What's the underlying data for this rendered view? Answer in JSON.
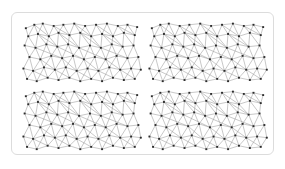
{
  "figure": {
    "title": "",
    "caption": "",
    "background_color": "#ffffff",
    "card_color": "#ffffff",
    "card_border_color": "#dcdcdc",
    "node_color": "#2b2b2b",
    "edge_color": "#9a9a9a",
    "panel_count": 4,
    "grid_rows": 2,
    "grid_cols": 2
  },
  "chart_data": {
    "type": "scatter",
    "title": "",
    "subtitle": "",
    "xlabel": "",
    "ylabel": "",
    "xlim": [
      0,
      100
    ],
    "ylim": [
      0,
      56
    ],
    "grid": false,
    "legend": [],
    "legend_position": "none",
    "annotations": [],
    "panels": [
      {
        "id": "panel-top-left",
        "label": "",
        "row": 0,
        "col": 0
      },
      {
        "id": "panel-top-right",
        "label": "",
        "row": 0,
        "col": 1
      },
      {
        "id": "panel-bottom-left",
        "label": "",
        "row": 1,
        "col": 0
      },
      {
        "id": "panel-bottom-right",
        "label": "",
        "row": 1,
        "col": 1
      }
    ],
    "node_marker": "square",
    "node_size": 1.6,
    "nodes": [
      [
        4,
        48
      ],
      [
        11,
        51
      ],
      [
        18,
        52
      ],
      [
        27,
        50
      ],
      [
        35,
        51
      ],
      [
        44,
        52
      ],
      [
        53,
        50
      ],
      [
        62,
        51
      ],
      [
        71,
        52
      ],
      [
        80,
        50
      ],
      [
        88,
        51
      ],
      [
        96,
        49
      ],
      [
        6,
        41
      ],
      [
        14,
        43
      ],
      [
        23,
        41
      ],
      [
        31,
        44
      ],
      [
        40,
        42
      ],
      [
        49,
        44
      ],
      [
        58,
        41
      ],
      [
        67,
        43
      ],
      [
        76,
        41
      ],
      [
        85,
        44
      ],
      [
        94,
        42
      ],
      [
        3,
        33
      ],
      [
        12,
        31
      ],
      [
        21,
        34
      ],
      [
        30,
        32
      ],
      [
        39,
        34
      ],
      [
        48,
        31
      ],
      [
        57,
        33
      ],
      [
        66,
        31
      ],
      [
        75,
        34
      ],
      [
        84,
        32
      ],
      [
        93,
        33
      ],
      [
        7,
        23
      ],
      [
        16,
        21
      ],
      [
        25,
        24
      ],
      [
        34,
        22
      ],
      [
        43,
        24
      ],
      [
        52,
        21
      ],
      [
        61,
        23
      ],
      [
        70,
        21
      ],
      [
        79,
        24
      ],
      [
        88,
        22
      ],
      [
        97,
        23
      ],
      [
        2,
        13
      ],
      [
        10,
        11
      ],
      [
        19,
        14
      ],
      [
        28,
        12
      ],
      [
        37,
        14
      ],
      [
        46,
        11
      ],
      [
        55,
        13
      ],
      [
        64,
        11
      ],
      [
        73,
        14
      ],
      [
        82,
        12
      ],
      [
        91,
        13
      ],
      [
        99,
        12
      ],
      [
        5,
        4
      ],
      [
        13,
        2
      ],
      [
        22,
        5
      ],
      [
        31,
        3
      ],
      [
        40,
        5
      ],
      [
        49,
        2
      ],
      [
        58,
        4
      ],
      [
        67,
        2
      ],
      [
        76,
        5
      ],
      [
        85,
        3
      ],
      [
        94,
        4
      ]
    ],
    "edges": [
      [
        0,
        1
      ],
      [
        1,
        2
      ],
      [
        2,
        3
      ],
      [
        3,
        4
      ],
      [
        4,
        5
      ],
      [
        5,
        6
      ],
      [
        6,
        7
      ],
      [
        7,
        8
      ],
      [
        8,
        9
      ],
      [
        9,
        10
      ],
      [
        10,
        11
      ],
      [
        12,
        13
      ],
      [
        13,
        14
      ],
      [
        14,
        15
      ],
      [
        15,
        16
      ],
      [
        16,
        17
      ],
      [
        17,
        18
      ],
      [
        18,
        19
      ],
      [
        19,
        20
      ],
      [
        20,
        21
      ],
      [
        21,
        22
      ],
      [
        23,
        24
      ],
      [
        24,
        25
      ],
      [
        25,
        26
      ],
      [
        26,
        27
      ],
      [
        27,
        28
      ],
      [
        28,
        29
      ],
      [
        29,
        30
      ],
      [
        30,
        31
      ],
      [
        31,
        32
      ],
      [
        32,
        33
      ],
      [
        34,
        35
      ],
      [
        35,
        36
      ],
      [
        36,
        37
      ],
      [
        37,
        38
      ],
      [
        38,
        39
      ],
      [
        39,
        40
      ],
      [
        40,
        41
      ],
      [
        41,
        42
      ],
      [
        42,
        43
      ],
      [
        43,
        44
      ],
      [
        45,
        46
      ],
      [
        46,
        47
      ],
      [
        47,
        48
      ],
      [
        48,
        49
      ],
      [
        49,
        50
      ],
      [
        50,
        51
      ],
      [
        51,
        52
      ],
      [
        52,
        53
      ],
      [
        53,
        54
      ],
      [
        54,
        55
      ],
      [
        55,
        56
      ],
      [
        57,
        58
      ],
      [
        58,
        59
      ],
      [
        59,
        60
      ],
      [
        60,
        61
      ],
      [
        61,
        62
      ],
      [
        62,
        63
      ],
      [
        63,
        64
      ],
      [
        64,
        65
      ],
      [
        65,
        66
      ],
      [
        66,
        67
      ],
      [
        0,
        12
      ],
      [
        1,
        12
      ],
      [
        1,
        13
      ],
      [
        2,
        13
      ],
      [
        2,
        14
      ],
      [
        3,
        14
      ],
      [
        3,
        15
      ],
      [
        4,
        15
      ],
      [
        4,
        16
      ],
      [
        5,
        16
      ],
      [
        5,
        17
      ],
      [
        6,
        17
      ],
      [
        6,
        18
      ],
      [
        7,
        18
      ],
      [
        7,
        19
      ],
      [
        8,
        19
      ],
      [
        8,
        20
      ],
      [
        9,
        20
      ],
      [
        9,
        21
      ],
      [
        10,
        21
      ],
      [
        10,
        22
      ],
      [
        11,
        22
      ],
      [
        12,
        23
      ],
      [
        12,
        24
      ],
      [
        13,
        24
      ],
      [
        13,
        25
      ],
      [
        14,
        25
      ],
      [
        14,
        26
      ],
      [
        15,
        26
      ],
      [
        15,
        27
      ],
      [
        16,
        27
      ],
      [
        16,
        28
      ],
      [
        17,
        28
      ],
      [
        17,
        29
      ],
      [
        18,
        29
      ],
      [
        18,
        30
      ],
      [
        19,
        30
      ],
      [
        19,
        31
      ],
      [
        20,
        31
      ],
      [
        20,
        32
      ],
      [
        21,
        32
      ],
      [
        21,
        33
      ],
      [
        22,
        33
      ],
      [
        23,
        34
      ],
      [
        24,
        34
      ],
      [
        24,
        35
      ],
      [
        25,
        35
      ],
      [
        25,
        36
      ],
      [
        26,
        36
      ],
      [
        26,
        37
      ],
      [
        27,
        37
      ],
      [
        27,
        38
      ],
      [
        28,
        38
      ],
      [
        28,
        39
      ],
      [
        29,
        39
      ],
      [
        29,
        40
      ],
      [
        30,
        40
      ],
      [
        30,
        41
      ],
      [
        31,
        41
      ],
      [
        31,
        42
      ],
      [
        32,
        42
      ],
      [
        32,
        43
      ],
      [
        33,
        43
      ],
      [
        33,
        44
      ],
      [
        34,
        45
      ],
      [
        34,
        46
      ],
      [
        35,
        46
      ],
      [
        35,
        47
      ],
      [
        36,
        47
      ],
      [
        36,
        48
      ],
      [
        37,
        48
      ],
      [
        37,
        49
      ],
      [
        38,
        49
      ],
      [
        38,
        50
      ],
      [
        39,
        50
      ],
      [
        39,
        51
      ],
      [
        40,
        51
      ],
      [
        40,
        52
      ],
      [
        41,
        52
      ],
      [
        41,
        53
      ],
      [
        42,
        53
      ],
      [
        42,
        54
      ],
      [
        43,
        54
      ],
      [
        43,
        55
      ],
      [
        44,
        55
      ],
      [
        44,
        56
      ],
      [
        45,
        57
      ],
      [
        46,
        57
      ],
      [
        46,
        58
      ],
      [
        47,
        58
      ],
      [
        47,
        59
      ],
      [
        48,
        59
      ],
      [
        48,
        60
      ],
      [
        49,
        60
      ],
      [
        49,
        61
      ],
      [
        50,
        61
      ],
      [
        50,
        62
      ],
      [
        51,
        62
      ],
      [
        51,
        63
      ],
      [
        52,
        63
      ],
      [
        52,
        64
      ],
      [
        53,
        64
      ],
      [
        53,
        65
      ],
      [
        54,
        65
      ],
      [
        54,
        66
      ],
      [
        55,
        66
      ],
      [
        55,
        67
      ],
      [
        56,
        67
      ],
      [
        1,
        14
      ],
      [
        3,
        16
      ],
      [
        5,
        18
      ],
      [
        7,
        20
      ],
      [
        9,
        22
      ],
      [
        13,
        26
      ],
      [
        15,
        28
      ],
      [
        17,
        30
      ],
      [
        19,
        32
      ],
      [
        24,
        37
      ],
      [
        26,
        39
      ],
      [
        28,
        41
      ],
      [
        30,
        43
      ],
      [
        35,
        48
      ],
      [
        37,
        50
      ],
      [
        39,
        52
      ],
      [
        41,
        54
      ],
      [
        46,
        59
      ],
      [
        48,
        61
      ],
      [
        50,
        63
      ],
      [
        52,
        65
      ],
      [
        54,
        67
      ]
    ]
  }
}
